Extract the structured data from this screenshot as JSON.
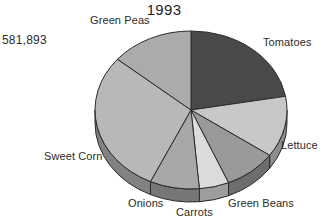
{
  "chart_data": {
    "type": "pie",
    "title": "1993",
    "total_label": "581,893",
    "legend_position": "outside-callout",
    "grid": false,
    "categories": [
      "Tomatoes",
      "Lettuce",
      "Green Beans",
      "Carrots",
      "Onions",
      "Sweet Corn",
      "Green Peas"
    ],
    "values": [
      22.2,
      12.5,
      8.9,
      5.0,
      8.3,
      29.2,
      13.9
    ],
    "value_unit": "percent",
    "angles_deg": [
      80,
      45,
      32,
      18,
      30,
      105,
      50
    ],
    "colors": [
      "#4a4a4a",
      "#c8c8c8",
      "#9a9a9a",
      "#dcdcdc",
      "#a8a8a8",
      "#b8b8b8",
      "#ababab"
    ],
    "xlabel": "",
    "ylabel": ""
  },
  "chart": {
    "title": "1993",
    "total_value": "581,893",
    "slices": [
      {
        "label": "Tomatoes",
        "color": "#4a4a4a",
        "side_color": "#343434",
        "start": 0,
        "end": 80
      },
      {
        "label": "Lettuce",
        "color": "#c8c8c8",
        "side_color": "#8e8e8e",
        "start": 80,
        "end": 125
      },
      {
        "label": "Green Beans",
        "color": "#9a9a9a",
        "side_color": "#6d6d6d",
        "start": 125,
        "end": 157
      },
      {
        "label": "Carrots",
        "color": "#dcdcdc",
        "side_color": "#9d9d9d",
        "start": 157,
        "end": 175
      },
      {
        "label": "Onions",
        "color": "#a8a8a8",
        "side_color": "#777777",
        "start": 175,
        "end": 205
      },
      {
        "label": "Sweet Corn",
        "color": "#b8b8b8",
        "side_color": "#828282",
        "start": 205,
        "end": 310
      },
      {
        "label": "Green Peas",
        "color": "#ababab",
        "side_color": "#7a7a7a",
        "start": 310,
        "end": 360
      }
    ]
  }
}
